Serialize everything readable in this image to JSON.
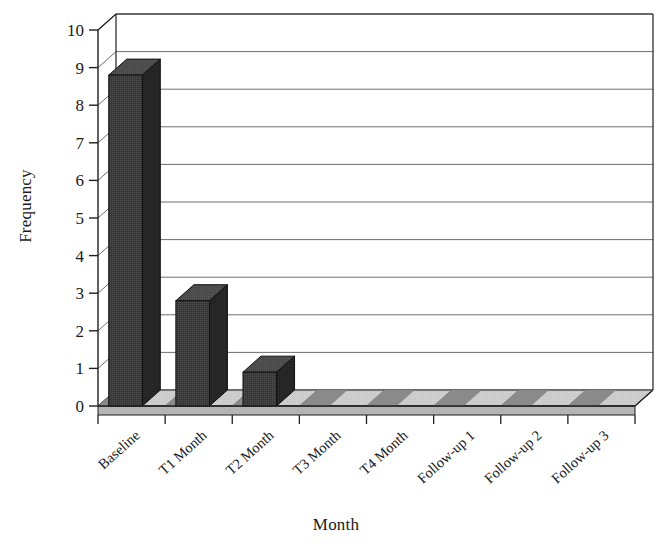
{
  "chart_data": {
    "type": "bar",
    "title": "",
    "subtitle": "",
    "xlabel": "Month",
    "ylabel": "Frequency",
    "categories": [
      "Baseline",
      "T1 Month",
      "T2 Month",
      "T3 Month",
      "T4 Month",
      "Follow-up 1",
      "Follow-up 2",
      "Follow-up 3"
    ],
    "values": [
      8.8,
      2.8,
      0.9,
      0,
      0,
      0,
      0,
      0
    ],
    "ylim": [
      0,
      10
    ],
    "yticks": [
      0,
      1,
      2,
      3,
      4,
      5,
      6,
      7,
      8,
      9,
      10
    ],
    "ytick_labels": [
      "0",
      "1",
      "2",
      "3",
      "4",
      "5",
      "6",
      "7",
      "8",
      "9",
      "10"
    ],
    "grid": true,
    "grid_axis": "y",
    "legend": false,
    "legend_position": "none",
    "style": "3d-column",
    "colors": {
      "bar_front": "#3d3d3d",
      "bar_side": "#242424",
      "bar_top": "#555555",
      "floor_top": "#c9c9c9",
      "floor_front": "#b4b4b4",
      "grid": "#6e6e6e",
      "axis": "#1f1f1f",
      "background": "#ffffff",
      "text": "#1a1a1a"
    }
  },
  "axes": {
    "y_title": "Frequency",
    "x_title": "Month"
  }
}
